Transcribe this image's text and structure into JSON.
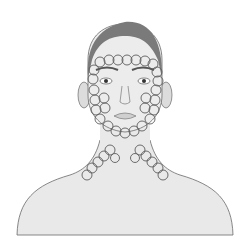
{
  "illustration": {
    "subject": "head-neck-shoulders-front-view",
    "pattern": "circular-massage-strokes",
    "regions": [
      "forehead",
      "temples",
      "cheeks",
      "jawline",
      "chin",
      "neck-left",
      "neck-right"
    ]
  },
  "colors": {
    "background": "#ffffff",
    "skin": "#e9e9e9",
    "hair": "#7a7a7a",
    "outline": "#6a6a6a",
    "circles": "#5c5c5c"
  }
}
